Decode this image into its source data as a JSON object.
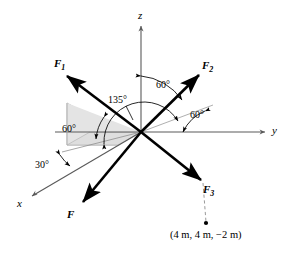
{
  "figure": {
    "background": "#ffffff",
    "stroke_color": "#000000",
    "axis_color": "#5a5a5a",
    "guide_color": "#8a8a8a",
    "shade_fill": "#e6e6e6",
    "shade_stroke": "#b0b0b0",
    "dashed_color": "#9a9a9a"
  },
  "axes": [
    {
      "id": "z",
      "label": "z",
      "x": 141,
      "y": 18
    },
    {
      "id": "y",
      "label": "y",
      "x": 274,
      "y": 131
    },
    {
      "id": "x",
      "label": "x",
      "x": 19,
      "y": 204
    }
  ],
  "forces": [
    {
      "id": "F1",
      "label": "F",
      "sub": "1",
      "x": 55,
      "y": 60
    },
    {
      "id": "F2",
      "label": "F",
      "sub": "2",
      "x": 203,
      "y": 62
    },
    {
      "id": "F3",
      "label": "F",
      "sub": "3",
      "x": 203,
      "y": 186
    },
    {
      "id": "F",
      "label": "F",
      "sub": "",
      "x": 68,
      "y": 213
    }
  ],
  "angles": [
    {
      "id": "ang-60-plane",
      "label": "60°",
      "x": 63,
      "y": 130
    },
    {
      "id": "ang-135",
      "label": "135°",
      "x": 111,
      "y": 101
    },
    {
      "id": "ang-60-z",
      "label": "60°",
      "x": 159,
      "y": 86
    },
    {
      "id": "ang-60-y",
      "label": "60°",
      "x": 193,
      "y": 116
    },
    {
      "id": "ang-30",
      "label": "30°",
      "x": 37,
      "y": 166
    }
  ],
  "coordinate_point": {
    "label": "(4 m, 4 m, −2 m)",
    "x": 197,
    "y": 232,
    "dot_x": 206,
    "dot_y": 224
  }
}
